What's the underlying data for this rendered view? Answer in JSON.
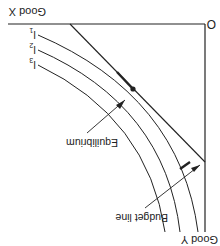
{
  "figure": {
    "rotation_deg": 180,
    "origin_label": "O",
    "x_axis_label": "Good X",
    "y_axis_label": "Good Y",
    "curves": [
      {
        "label": "I",
        "subscript": "1"
      },
      {
        "label": "I",
        "subscript": "2"
      },
      {
        "label": "I",
        "subscript": "3"
      }
    ],
    "budget_line_label": "Budget line",
    "equilibrium_label": "Equilibrium",
    "colors": {
      "ink": "#222222",
      "background": "#ffffff"
    }
  }
}
